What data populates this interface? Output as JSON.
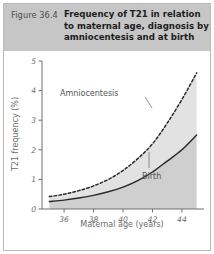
{
  "figure": {
    "number_label": "Figure 36.4",
    "title_line1": "Frequency of T21 in relation",
    "title_line2": "to maternal age, diagnosis by",
    "title_line3": "amniocentesis and at birth",
    "band_color": "#c6c6c6",
    "border_color": "#b9b9b9"
  },
  "chart_data": {
    "type": "line",
    "title": "Frequency of T21 in relation to maternal age, diagnosis by amniocentesis and at birth",
    "xlabel": "Maternal age (years)",
    "ylabel": "T21 frequency (%)",
    "xlim": [
      34.5,
      45.5
    ],
    "ylim": [
      0,
      5
    ],
    "xticks": [
      36,
      38,
      40,
      42,
      44
    ],
    "yticks": [
      0,
      1,
      2,
      3,
      4,
      5
    ],
    "xtick_labels": [
      "36",
      "38",
      "40",
      "42",
      "44"
    ],
    "ytick_labels": [
      "0",
      "1",
      "2",
      "3",
      "4",
      "5"
    ],
    "grid": false,
    "legend_position": "inline-annotations",
    "x": [
      35,
      36,
      37,
      38,
      39,
      40,
      41,
      42,
      43,
      44,
      45
    ],
    "series": [
      {
        "name": "Amniocentesis",
        "style": "dashed",
        "color": "#2b2b2b",
        "label": "Amniocentesis",
        "values": [
          0.42,
          0.5,
          0.62,
          0.78,
          1.0,
          1.3,
          1.7,
          2.2,
          2.9,
          3.7,
          4.6
        ]
      },
      {
        "name": "Birth",
        "style": "solid",
        "color": "#2b2b2b",
        "label": "Birth",
        "values": [
          0.25,
          0.3,
          0.37,
          0.46,
          0.58,
          0.74,
          0.96,
          1.25,
          1.62,
          2.0,
          2.5
        ]
      }
    ],
    "shading": [
      {
        "name": "between-curves",
        "color": "#e2e2e2"
      },
      {
        "name": "under-birth",
        "color": "#cfcfcf"
      }
    ]
  }
}
